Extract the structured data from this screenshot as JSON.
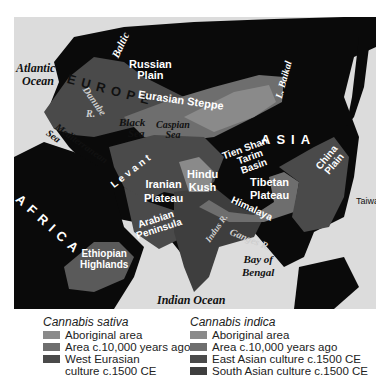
{
  "map": {
    "colors": {
      "sea": "#dcdcdc",
      "land": "#0a0a0a",
      "aboriginal": "#8a8a8a",
      "area_10000": "#6e6e6e",
      "culture": "#4a4a4a",
      "south_asian": "#3e3e3e"
    },
    "labels": {
      "atlantic_ocean_1": "Atlantic",
      "atlantic_ocean_2": "Ocean",
      "baltic": "Baltic",
      "europe": "EUROPE",
      "russian_plain_1": "Russian",
      "russian_plain_2": "Plain",
      "danube_1": "Danube",
      "danube_2": "R.",
      "eurasian_steppe": "Eurasian Steppe",
      "lake_baikal": "L. Baikal",
      "black_sea_1": "Black",
      "black_sea_2": "Sea",
      "caspian_sea_1": "Caspian",
      "caspian_sea_2": "Sea",
      "mediterranean_sea_1": "Mediterranean",
      "mediterranean_sea_2": "Sea",
      "asia": "ASIA",
      "tien_shan": "Tien Shan",
      "tarim_basin_1": "Tarim",
      "tarim_basin_2": "Basin",
      "levant": "Levant",
      "iranian_plateau_1": "Iranian",
      "iranian_plateau_2": "Plateau",
      "hindu_kush_1": "Hindu",
      "hindu_kush_2": "Kush",
      "tibetan_plateau_1": "Tibetan",
      "tibetan_plateau_2": "Plateau",
      "himalaya": "Himalaya",
      "china_plain_1": "China",
      "china_plain_2": "Plain",
      "africa": "AFRICA",
      "indus": "Indus R.",
      "ganges": "Ganges R.",
      "taiwan": "Taiwan",
      "arabian_peninsula_1": "Arabian",
      "arabian_peninsula_2": "Peninsula",
      "ethiopian_highlands_1": "Ethiopian",
      "ethiopian_highlands_2": "Highlands",
      "bay_of_bengal_1": "Bay of",
      "bay_of_bengal_2": "Bengal",
      "indian_ocean": "Indian Ocean"
    }
  },
  "legend": {
    "sativa": {
      "title": "Cannabis sativa",
      "items": [
        {
          "label": "Aboriginal area",
          "color": "#8a8a8a"
        },
        {
          "label": "Area c.10,000 years ago",
          "color": "#6e6e6e"
        },
        {
          "label": "West Eurasian culture c.1500 CE",
          "color": "#4a4a4a"
        }
      ]
    },
    "indica": {
      "title": "Cannabis indica",
      "items": [
        {
          "label": "Aboriginal area",
          "color": "#8a8a8a"
        },
        {
          "label": "Area c.10,000 years ago",
          "color": "#6e6e6e"
        },
        {
          "label": "East Asian culture c.1500 CE",
          "color": "#4a4a4a"
        },
        {
          "label": "South Asian culture c.1500 CE",
          "color": "#3e3e3e"
        }
      ]
    }
  }
}
